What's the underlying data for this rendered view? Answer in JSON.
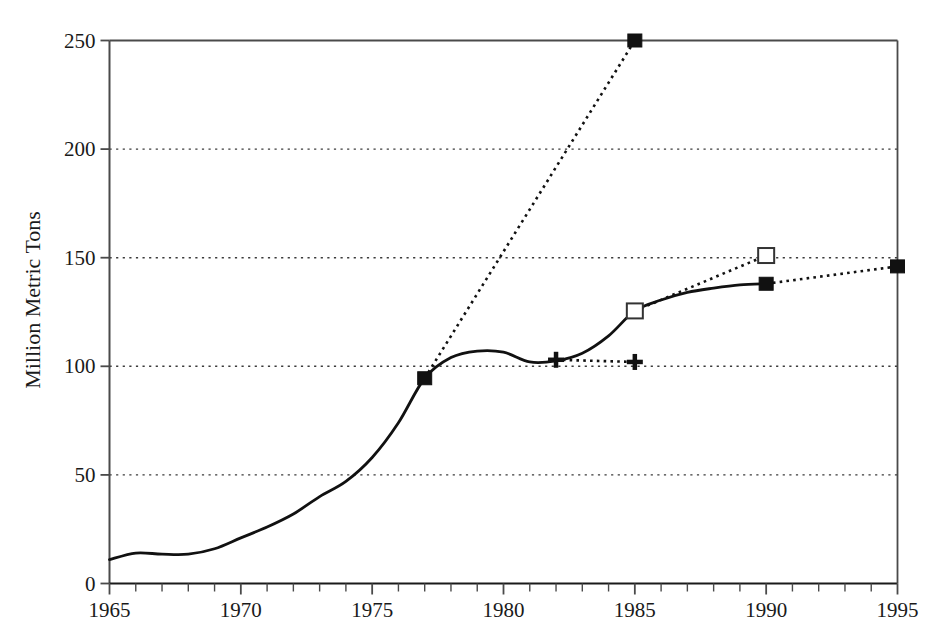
{
  "chart_data": {
    "type": "line",
    "title": "",
    "xlabel": "",
    "ylabel": "Million Metric Tons",
    "xlim": [
      1965,
      1995
    ],
    "ylim": [
      0,
      250
    ],
    "xticks": [
      1965,
      1970,
      1975,
      1980,
      1985,
      1990,
      1995
    ],
    "xtick_labels": [
      "1965",
      "1970",
      "1975",
      "1980",
      "1985",
      "1990",
      "1995"
    ],
    "x_minor_tick_interval": 1,
    "yticks": [
      0,
      50,
      100,
      150,
      200,
      250
    ],
    "ytick_labels": [
      "0",
      "50",
      "100",
      "150",
      "200",
      "250"
    ],
    "grid": "horizontal-dotted",
    "legend": "none",
    "series": [
      {
        "name": "historical",
        "style": "solid",
        "marker": "none",
        "x": [
          1965,
          1966,
          1967,
          1968,
          1969,
          1970,
          1971,
          1972,
          1973,
          1974,
          1975,
          1976,
          1977,
          1978,
          1979,
          1980,
          1981,
          1982,
          1983,
          1984,
          1985,
          1986,
          1987,
          1988,
          1989,
          1990
        ],
        "y": [
          11,
          14,
          13.5,
          13.5,
          16,
          21,
          26,
          32,
          40,
          47,
          58,
          74,
          94.5,
          104,
          107,
          106.5,
          102,
          102.5,
          106,
          114,
          125.5,
          130.5,
          134,
          136,
          137.5,
          138
        ]
      },
      {
        "name": "projection-high",
        "style": "dotted",
        "marker": "filled-square",
        "x": [
          1977,
          1985
        ],
        "y": [
          94.5,
          250
        ]
      },
      {
        "name": "projection-flat",
        "style": "dotted",
        "marker": "plus",
        "x": [
          1982,
          1985
        ],
        "y": [
          103,
          102
        ]
      },
      {
        "name": "projection-mid",
        "style": "dotted",
        "marker": "open-square",
        "x": [
          1985,
          1990
        ],
        "y": [
          125.5,
          151
        ]
      },
      {
        "name": "projection-low",
        "style": "dotted",
        "marker": "filled-square",
        "x": [
          1990,
          1995
        ],
        "y": [
          138,
          146
        ]
      }
    ],
    "markers": [
      {
        "name": "marker-1977-filled-square",
        "x": 1977,
        "y": 94.5,
        "shape": "filled-square"
      },
      {
        "name": "marker-1985-filled-square",
        "x": 1985,
        "y": 250,
        "shape": "filled-square"
      },
      {
        "name": "marker-1982-plus",
        "x": 1982,
        "y": 103,
        "shape": "plus"
      },
      {
        "name": "marker-1985-plus",
        "x": 1985,
        "y": 102,
        "shape": "plus"
      },
      {
        "name": "marker-1985-open-square",
        "x": 1985,
        "y": 125.5,
        "shape": "open-square"
      },
      {
        "name": "marker-1990-open-square",
        "x": 1990,
        "y": 151,
        "shape": "open-square"
      },
      {
        "name": "marker-1990-filled-square",
        "x": 1990,
        "y": 138,
        "shape": "filled-square"
      },
      {
        "name": "marker-1995-filled-square",
        "x": 1995,
        "y": 146,
        "shape": "filled-square"
      }
    ],
    "colors": {
      "line": "#111111",
      "grid": "#3b3b3b",
      "axis": "#4a4a4a",
      "background": "#ffffff"
    }
  }
}
